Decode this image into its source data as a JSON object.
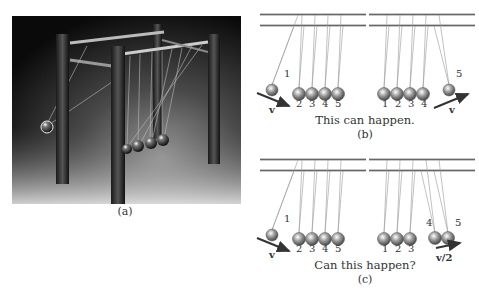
{
  "figure": {
    "panel_a": {
      "label": "(a)",
      "description": "Photo of Newton's cradle with one ball raised on the left and four balls at rest"
    },
    "panel_b": {
      "label": "(b)",
      "caption": "This can happen.",
      "left": {
        "ball_numbers": [
          "1",
          "2",
          "3",
          "4",
          "5"
        ],
        "velocity_label": "v"
      },
      "right": {
        "ball_numbers": [
          "1",
          "2",
          "3",
          "4",
          "5"
        ],
        "velocity_label": "v"
      }
    },
    "panel_c": {
      "label": "(c)",
      "caption": "Can this happen?",
      "left": {
        "ball_numbers": [
          "1",
          "2",
          "3",
          "4",
          "5"
        ],
        "velocity_label": "v"
      },
      "right": {
        "ball_numbers": [
          "1",
          "2",
          "3",
          "4",
          "5"
        ],
        "velocity_label": "v/2"
      }
    }
  }
}
